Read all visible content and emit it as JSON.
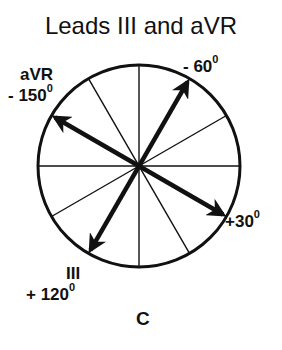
{
  "title": "Leads III and aVR",
  "panel_label": "C",
  "diagram": {
    "type": "hexaxial-reference-circle",
    "center": [
      139,
      166
    ],
    "radius": 101,
    "divider_angles_deg": [
      0,
      30,
      60,
      90,
      120,
      150
    ],
    "arrows": [
      {
        "lead": "",
        "angle_deg": -60,
        "label": "- 60",
        "degree_symbol": "0"
      },
      {
        "lead": "aVR",
        "angle_deg": -150,
        "label": "- 150",
        "degree_symbol": "0"
      },
      {
        "lead": "",
        "angle_deg": 30,
        "label": "+30",
        "degree_symbol": "0"
      },
      {
        "lead": "III",
        "angle_deg": 120,
        "label": "+ 120",
        "degree_symbol": "0"
      }
    ]
  },
  "labels": {
    "avr_lead": "aVR",
    "avr_angle": "- 150",
    "neg60_angle": "- 60",
    "pos30_angle": "+30",
    "iii_lead": "III",
    "pos120_angle": "+ 120",
    "degree": "0"
  }
}
